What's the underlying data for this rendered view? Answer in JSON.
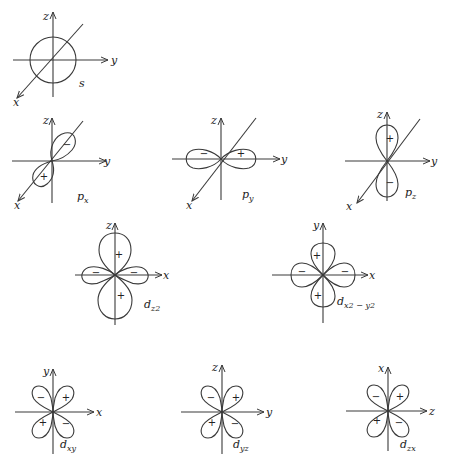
{
  "colors": {
    "line": "#3a3a3a",
    "text": "#222222",
    "background": "#ffffff"
  },
  "orbitals": {
    "s": {
      "name": "s",
      "axes": {
        "vertical": "z",
        "horizontal": "y",
        "diagonal": "x"
      },
      "signs": []
    },
    "px": {
      "name": "p",
      "sub": "x",
      "axes": {
        "vertical": "z",
        "horizontal": "y",
        "diagonal": "x"
      },
      "signs": [
        "−",
        "+"
      ]
    },
    "py": {
      "name": "p",
      "sub": "y",
      "axes": {
        "vertical": "z",
        "horizontal": "y",
        "diagonal": "x"
      },
      "signs": [
        "−",
        "+"
      ]
    },
    "pz": {
      "name": "p",
      "sub": "z",
      "axes": {
        "vertical": "z",
        "horizontal": "y",
        "diagonal": "x"
      },
      "signs": [
        "+",
        "−"
      ]
    },
    "dz2": {
      "name": "d",
      "sub": "z2",
      "axes": {
        "vertical": "z",
        "horizontal": "x"
      },
      "signs": [
        "+",
        "+",
        "−",
        "−"
      ]
    },
    "dx2y2": {
      "name": "d",
      "sub": "x2 − y2",
      "axes": {
        "vertical": "y",
        "horizontal": "x"
      },
      "signs": [
        "+",
        "+",
        "−",
        "−"
      ]
    },
    "dxy": {
      "name": "d",
      "sub": "xy",
      "axes": {
        "vertical": "y",
        "horizontal": "x"
      },
      "signs": [
        "−",
        "+",
        "+",
        "−"
      ]
    },
    "dyz": {
      "name": "d",
      "sub": "yz",
      "axes": {
        "vertical": "z",
        "horizontal": "y"
      },
      "signs": [
        "−",
        "+",
        "+",
        "−"
      ]
    },
    "dzx": {
      "name": "d",
      "sub": "zx",
      "axes": {
        "vertical": "x",
        "horizontal": "z"
      },
      "signs": [
        "−",
        "+",
        "+",
        "−"
      ]
    }
  }
}
